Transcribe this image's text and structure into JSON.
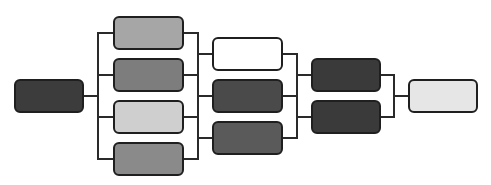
{
  "diagram": {
    "type": "tree",
    "direction": "left-to-right",
    "nodes": [
      {
        "id": "root",
        "level": 0,
        "fill": "#3c3c3c"
      },
      {
        "id": "l1-a",
        "level": 1,
        "fill": "#a6a6a6"
      },
      {
        "id": "l1-b",
        "level": 1,
        "fill": "#7d7d7d"
      },
      {
        "id": "l1-c",
        "level": 1,
        "fill": "#cfcfcf"
      },
      {
        "id": "l1-d",
        "level": 1,
        "fill": "#8a8a8a"
      },
      {
        "id": "l2-a",
        "level": 2,
        "fill": "#ffffff"
      },
      {
        "id": "l2-b",
        "level": 2,
        "fill": "#4a4a4a"
      },
      {
        "id": "l2-c",
        "level": 2,
        "fill": "#5a5a5a"
      },
      {
        "id": "l3-a",
        "level": 3,
        "fill": "#3a3a3a"
      },
      {
        "id": "l3-b",
        "level": 3,
        "fill": "#3a3a3a"
      },
      {
        "id": "final",
        "level": 4,
        "fill": "#e6e6e6"
      }
    ],
    "edges": [
      [
        "root",
        "l1-a"
      ],
      [
        "root",
        "l1-b"
      ],
      [
        "root",
        "l1-c"
      ],
      [
        "root",
        "l1-d"
      ],
      [
        "l1-a",
        "l2-a"
      ],
      [
        "l1-b",
        "l2-b"
      ],
      [
        "l1-c",
        "l2-b"
      ],
      [
        "l1-d",
        "l2-c"
      ],
      [
        "l2-a",
        "l3-a"
      ],
      [
        "l2-b",
        "l3-a"
      ],
      [
        "l2-b",
        "l3-b"
      ],
      [
        "l2-c",
        "l3-b"
      ],
      [
        "l3-a",
        "final"
      ],
      [
        "l3-b",
        "final"
      ]
    ],
    "labels": []
  }
}
